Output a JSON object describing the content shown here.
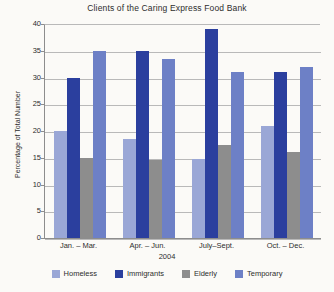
{
  "chart_data": {
    "type": "bar",
    "title": "Clients of the Caring Express Food Bank",
    "xlabel": "2004",
    "ylabel": "Percentage of Total Number",
    "categories": [
      "Jan. – Mar.",
      "Apr. – Jun.",
      "July–Sept.",
      "Oct. – Dec."
    ],
    "series": [
      {
        "name": "Homeless",
        "color": "#9aa7d6",
        "values": [
          20,
          18.5,
          14.8,
          21
        ]
      },
      {
        "name": "Immigrants",
        "color": "#2b3f9e",
        "values": [
          30,
          35,
          39,
          31
        ]
      },
      {
        "name": "Elderly",
        "color": "#8d8d8d",
        "values": [
          15,
          14.5,
          17.3,
          16
        ]
      },
      {
        "name": "Temporary",
        "color": "#6d80c6",
        "values": [
          35,
          33.5,
          31,
          32
        ]
      }
    ],
    "ylim": [
      0,
      40
    ],
    "yticks": [
      0,
      5,
      10,
      15,
      20,
      25,
      30,
      35,
      40
    ],
    "grid": true,
    "legend_position": "bottom"
  }
}
